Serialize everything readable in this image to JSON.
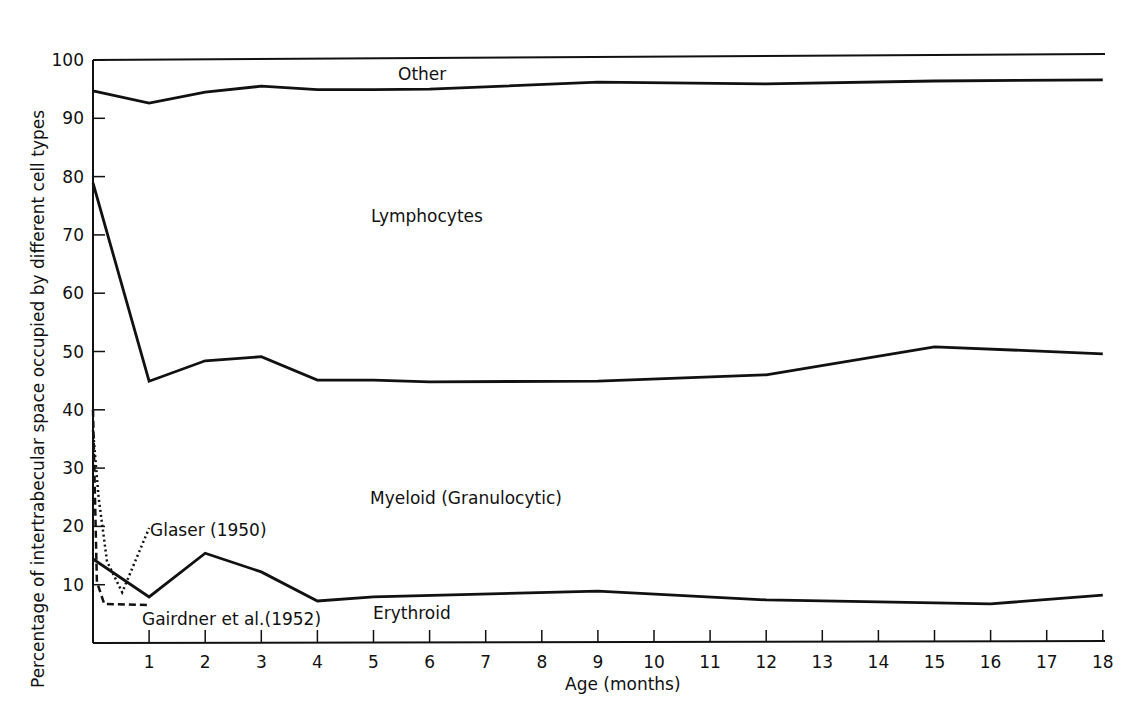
{
  "chart_data": {
    "type": "line",
    "title": "",
    "xlabel": "Age (months)",
    "ylabel": "Percentage of intertrabecular space occupied by different cell types",
    "xlim": [
      0,
      18
    ],
    "ylim": [
      0,
      100
    ],
    "grid": false,
    "x_ticks": [
      1,
      2,
      3,
      4,
      5,
      6,
      7,
      8,
      9,
      10,
      11,
      12,
      13,
      14,
      15,
      16,
      17,
      18
    ],
    "y_ticks": [
      10,
      20,
      30,
      40,
      50,
      60,
      70,
      80,
      90,
      100
    ],
    "series": [
      {
        "name": "Other / Lymphocytes boundary",
        "style": "solid",
        "x": [
          0,
          1,
          2,
          3,
          4,
          5,
          6,
          9,
          12,
          15,
          18
        ],
        "values": [
          94.7,
          92.6,
          94.5,
          95.5,
          94.9,
          94.9,
          95.0,
          96.2,
          95.9,
          96.4,
          96.6
        ]
      },
      {
        "name": "Lymphocytes / Myeloid boundary",
        "style": "solid",
        "x": [
          0,
          1,
          2,
          3,
          4,
          5,
          6,
          9,
          12,
          15,
          18
        ],
        "values": [
          78.9,
          44.9,
          48.4,
          49.1,
          45.1,
          45.1,
          44.8,
          44.9,
          46.0,
          50.8,
          49.6
        ]
      },
      {
        "name": "Myeloid / Erythroid boundary",
        "style": "solid",
        "x": [
          0,
          1,
          2,
          3,
          4,
          5,
          9,
          12,
          16,
          18
        ],
        "values": [
          14.4,
          7.9,
          15.4,
          12.2,
          7.2,
          7.9,
          8.9,
          7.4,
          6.7,
          8.2
        ]
      },
      {
        "name": "Glaser (1950)",
        "style": "dotted",
        "x": [
          0,
          0.1,
          0.25,
          0.52,
          1.0
        ],
        "values": [
          36.5,
          25,
          14,
          8.7,
          19.7
        ]
      },
      {
        "name": "Gairdner et al.(1952)",
        "style": "dashed",
        "x": [
          0,
          0.07,
          0.2,
          1.0
        ],
        "values": [
          40,
          10.5,
          6.7,
          6.5
        ]
      }
    ],
    "region_labels": [
      "Other",
      "Lymphocytes",
      "Myeloid (Granulocytic)",
      "Erythroid"
    ],
    "annotations": [
      "Glaser (1950)",
      "Gairdner et al.(1952)"
    ]
  }
}
